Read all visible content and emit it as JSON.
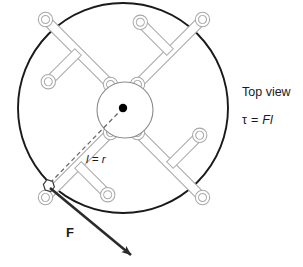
{
  "figure": {
    "title_label": "Top view",
    "formula": {
      "symbol": "τ",
      "equals": "=",
      "expression": "Fl",
      "full": "τ = Fl"
    },
    "length_label": "l = r",
    "force_label": "F",
    "colors": {
      "rim_stroke": "#1a1a1a",
      "wrench_stroke": "#a9a9a9",
      "hub_stroke": "#8c8c8c",
      "dashed_line": "#6b6b6b",
      "arrow": "#2b2b2b",
      "background": "#ffffff",
      "center_dot": "#000000"
    },
    "geometry": {
      "wheel_center_x": 123,
      "wheel_center_y": 108,
      "wheel_radius": 105,
      "hub_radius": 28,
      "force_point_x": 48,
      "force_point_y": 185,
      "arrow_tip_x": 133,
      "arrow_tip_y": 257,
      "spoke_count": 4
    }
  }
}
